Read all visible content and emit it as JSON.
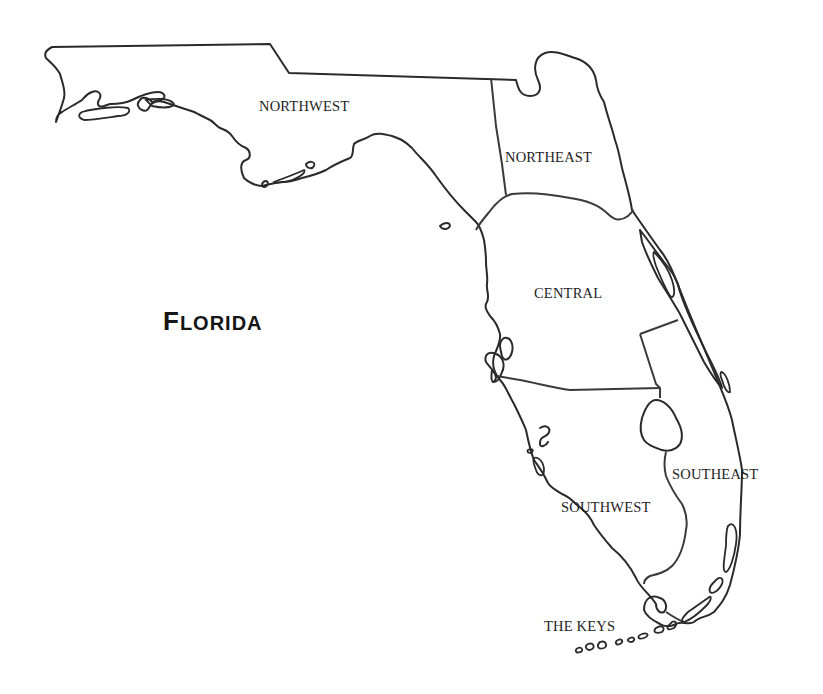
{
  "map": {
    "title": {
      "first_letter": "F",
      "rest": "LORIDA",
      "full": "Florida"
    },
    "regions": [
      {
        "id": "northwest",
        "label": "NORTHWEST"
      },
      {
        "id": "northeast",
        "label": "NORTHEAST"
      },
      {
        "id": "central",
        "label": "CENTRAL"
      },
      {
        "id": "southwest",
        "label": "SOUTHWEST"
      },
      {
        "id": "southeast",
        "label": "SOUTHEAST"
      },
      {
        "id": "the-keys",
        "label": "THE KEYS"
      }
    ],
    "colors": {
      "background": "#ffffff",
      "outline": "#2a2a2a",
      "text": "#1e1e1e"
    }
  }
}
